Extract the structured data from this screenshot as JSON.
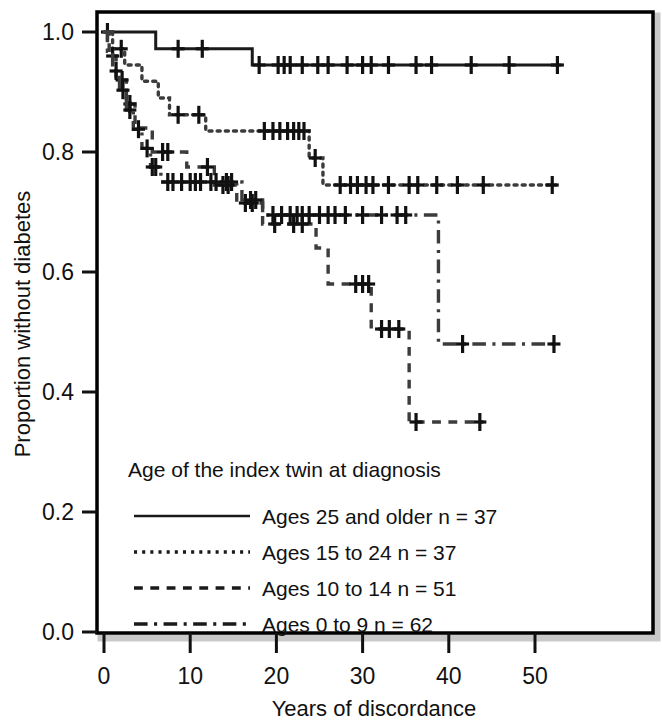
{
  "chart_data": {
    "type": "line",
    "subtype": "kaplan-meier-survival",
    "title": "",
    "xlabel": "Years of discordance",
    "ylabel": "Proportion without diabetes",
    "xlim": [
      0,
      57
    ],
    "ylim": [
      0.0,
      1.0
    ],
    "xticks": [
      0,
      10,
      20,
      30,
      40,
      50
    ],
    "xtick_labels": [
      "0",
      "10",
      "20",
      "30",
      "40",
      "50"
    ],
    "yticks": [
      0.0,
      0.2,
      0.4,
      0.6,
      0.8,
      1.0
    ],
    "ytick_labels": [
      "0.0",
      "0.2",
      "0.4",
      "0.6",
      "0.8",
      "1.0"
    ],
    "grid": false,
    "frame": true,
    "legend_position": "inside-lower-left",
    "legend_title": "Age of the index twin at diagnosis",
    "series": [
      {
        "name": "Ages 25 and older n = 37",
        "group_label": "Ages 25 and older",
        "n": 37,
        "line_style": "solid",
        "color": "#1a1a1a",
        "steps": [
          [
            0,
            1.0
          ],
          [
            6.0,
            1.0
          ],
          [
            6.0,
            0.972
          ],
          [
            17.2,
            0.972
          ],
          [
            17.2,
            0.945
          ],
          [
            53.0,
            0.945
          ]
        ],
        "censor_marks": [
          [
            0.4,
            1.0
          ],
          [
            8.6,
            0.972
          ],
          [
            11.4,
            0.972
          ],
          [
            18.0,
            0.945
          ],
          [
            20.2,
            0.945
          ],
          [
            20.9,
            0.945
          ],
          [
            21.6,
            0.945
          ],
          [
            23.0,
            0.945
          ],
          [
            24.8,
            0.945
          ],
          [
            26.0,
            0.945
          ],
          [
            28.2,
            0.945
          ],
          [
            30.0,
            0.945
          ],
          [
            31.0,
            0.945
          ],
          [
            33.0,
            0.945
          ],
          [
            36.2,
            0.945
          ],
          [
            38.0,
            0.945
          ],
          [
            42.6,
            0.945
          ],
          [
            47.0,
            0.945
          ],
          [
            52.6,
            0.945
          ]
        ]
      },
      {
        "name": "Ages 15 to 24 n = 37",
        "group_label": "Ages 15 to 24",
        "n": 37,
        "line_style": "dotted",
        "color": "#3c3c3c",
        "steps": [
          [
            0,
            1.0
          ],
          [
            1.0,
            1.0
          ],
          [
            1.0,
            0.972
          ],
          [
            2.4,
            0.972
          ],
          [
            2.4,
            0.945
          ],
          [
            4.4,
            0.945
          ],
          [
            4.4,
            0.918
          ],
          [
            6.3,
            0.918
          ],
          [
            6.3,
            0.89
          ],
          [
            7.6,
            0.89
          ],
          [
            7.6,
            0.862
          ],
          [
            11.8,
            0.862
          ],
          [
            11.8,
            0.835
          ],
          [
            23.8,
            0.835
          ],
          [
            23.8,
            0.79
          ],
          [
            25.4,
            0.79
          ],
          [
            25.4,
            0.745
          ],
          [
            52.4,
            0.745
          ]
        ],
        "censor_marks": [
          [
            2.0,
            0.972
          ],
          [
            8.6,
            0.862
          ],
          [
            11.0,
            0.862
          ],
          [
            18.6,
            0.835
          ],
          [
            19.6,
            0.835
          ],
          [
            20.4,
            0.835
          ],
          [
            21.3,
            0.835
          ],
          [
            22.0,
            0.835
          ],
          [
            22.6,
            0.835
          ],
          [
            23.2,
            0.835
          ],
          [
            24.5,
            0.79
          ],
          [
            27.4,
            0.745
          ],
          [
            28.6,
            0.745
          ],
          [
            29.4,
            0.745
          ],
          [
            30.4,
            0.745
          ],
          [
            31.2,
            0.745
          ],
          [
            33.0,
            0.745
          ],
          [
            35.4,
            0.745
          ],
          [
            36.4,
            0.745
          ],
          [
            38.6,
            0.745
          ],
          [
            41.0,
            0.745
          ],
          [
            44.0,
            0.745
          ],
          [
            52.0,
            0.745
          ]
        ]
      },
      {
        "name": "Ages 10 to 14 n = 51",
        "group_label": "Ages 10 to 14",
        "n": 51,
        "line_style": "dashed",
        "color": "#3c3c3c",
        "steps": [
          [
            0,
            1.0
          ],
          [
            0.6,
            1.0
          ],
          [
            0.6,
            0.96
          ],
          [
            1.4,
            0.96
          ],
          [
            1.4,
            0.92
          ],
          [
            2.6,
            0.92
          ],
          [
            2.6,
            0.88
          ],
          [
            3.6,
            0.88
          ],
          [
            3.6,
            0.84
          ],
          [
            5.6,
            0.84
          ],
          [
            5.6,
            0.8
          ],
          [
            9.6,
            0.8
          ],
          [
            9.6,
            0.775
          ],
          [
            12.8,
            0.775
          ],
          [
            12.8,
            0.745
          ],
          [
            15.4,
            0.745
          ],
          [
            15.4,
            0.715
          ],
          [
            18.4,
            0.715
          ],
          [
            18.4,
            0.68
          ],
          [
            24.6,
            0.68
          ],
          [
            24.6,
            0.64
          ],
          [
            26.0,
            0.64
          ],
          [
            26.0,
            0.58
          ],
          [
            31.0,
            0.58
          ],
          [
            31.0,
            0.505
          ],
          [
            35.4,
            0.505
          ],
          [
            35.4,
            0.35
          ],
          [
            44.0,
            0.35
          ]
        ],
        "censor_marks": [
          [
            1.0,
            0.96
          ],
          [
            2.1,
            0.92
          ],
          [
            3.0,
            0.88
          ],
          [
            6.8,
            0.8
          ],
          [
            7.4,
            0.8
          ],
          [
            12.0,
            0.775
          ],
          [
            13.8,
            0.745
          ],
          [
            14.4,
            0.745
          ],
          [
            16.4,
            0.715
          ],
          [
            17.2,
            0.715
          ],
          [
            19.8,
            0.68
          ],
          [
            22.0,
            0.68
          ],
          [
            23.0,
            0.68
          ],
          [
            29.2,
            0.58
          ],
          [
            30.0,
            0.58
          ],
          [
            30.7,
            0.58
          ],
          [
            32.2,
            0.505
          ],
          [
            33.1,
            0.505
          ],
          [
            34.2,
            0.505
          ],
          [
            36.2,
            0.35
          ],
          [
            43.6,
            0.35
          ]
        ]
      },
      {
        "name": "Ages 0 to 9 n = 62",
        "group_label": "Ages 0 to 9",
        "n": 62,
        "line_style": "dashdot",
        "color": "#3c3c3c",
        "steps": [
          [
            0,
            1.0
          ],
          [
            0.4,
            1.0
          ],
          [
            0.4,
            0.968
          ],
          [
            1.0,
            0.968
          ],
          [
            1.0,
            0.935
          ],
          [
            1.8,
            0.935
          ],
          [
            1.8,
            0.903
          ],
          [
            2.6,
            0.903
          ],
          [
            2.6,
            0.87
          ],
          [
            3.4,
            0.87
          ],
          [
            3.4,
            0.838
          ],
          [
            4.4,
            0.838
          ],
          [
            4.4,
            0.806
          ],
          [
            5.4,
            0.806
          ],
          [
            5.4,
            0.775
          ],
          [
            6.6,
            0.775
          ],
          [
            6.6,
            0.75
          ],
          [
            16.0,
            0.75
          ],
          [
            16.0,
            0.72
          ],
          [
            18.4,
            0.72
          ],
          [
            18.4,
            0.695
          ],
          [
            38.8,
            0.695
          ],
          [
            38.8,
            0.48
          ],
          [
            53.0,
            0.48
          ]
        ],
        "censor_marks": [
          [
            1.4,
            0.935
          ],
          [
            2.2,
            0.903
          ],
          [
            3.0,
            0.87
          ],
          [
            4.0,
            0.838
          ],
          [
            5.0,
            0.806
          ],
          [
            5.6,
            0.775
          ],
          [
            6.0,
            0.775
          ],
          [
            7.4,
            0.75
          ],
          [
            8.0,
            0.75
          ],
          [
            9.0,
            0.75
          ],
          [
            10.0,
            0.75
          ],
          [
            10.6,
            0.75
          ],
          [
            11.2,
            0.75
          ],
          [
            12.4,
            0.75
          ],
          [
            13.0,
            0.75
          ],
          [
            14.2,
            0.75
          ],
          [
            14.8,
            0.75
          ],
          [
            17.0,
            0.72
          ],
          [
            17.6,
            0.72
          ],
          [
            19.6,
            0.695
          ],
          [
            20.6,
            0.695
          ],
          [
            21.6,
            0.695
          ],
          [
            22.4,
            0.695
          ],
          [
            23.0,
            0.695
          ],
          [
            23.8,
            0.695
          ],
          [
            25.0,
            0.695
          ],
          [
            26.0,
            0.695
          ],
          [
            26.8,
            0.695
          ],
          [
            28.0,
            0.695
          ],
          [
            30.0,
            0.695
          ],
          [
            32.2,
            0.695
          ],
          [
            34.0,
            0.695
          ],
          [
            35.0,
            0.695
          ],
          [
            41.6,
            0.48
          ],
          [
            52.2,
            0.48
          ]
        ]
      }
    ]
  },
  "legend": {
    "title": "Age of the index twin at diagnosis",
    "entries": [
      {
        "label": "Ages 25 and older n = 37",
        "style": "solid"
      },
      {
        "label": "Ages 15 to 24 n = 37",
        "style": "dotted"
      },
      {
        "label": "Ages 10 to 14 n = 51",
        "style": "dashed"
      },
      {
        "label": "Ages 0 to 9 n = 62",
        "style": "dashdot"
      }
    ]
  },
  "axes": {
    "x_title": "Years of discordance",
    "y_title": "Proportion without diabetes",
    "x_labels": [
      "0",
      "10",
      "20",
      "30",
      "40",
      "50"
    ],
    "y_labels": [
      "0.0",
      "0.2",
      "0.4",
      "0.6",
      "0.8",
      "1.0"
    ]
  },
  "colors": {
    "line": "#1a1a1a",
    "frame": "#000000",
    "frame_shadow": "#bdbdbd",
    "background": "#ffffff",
    "text": "#111111"
  }
}
